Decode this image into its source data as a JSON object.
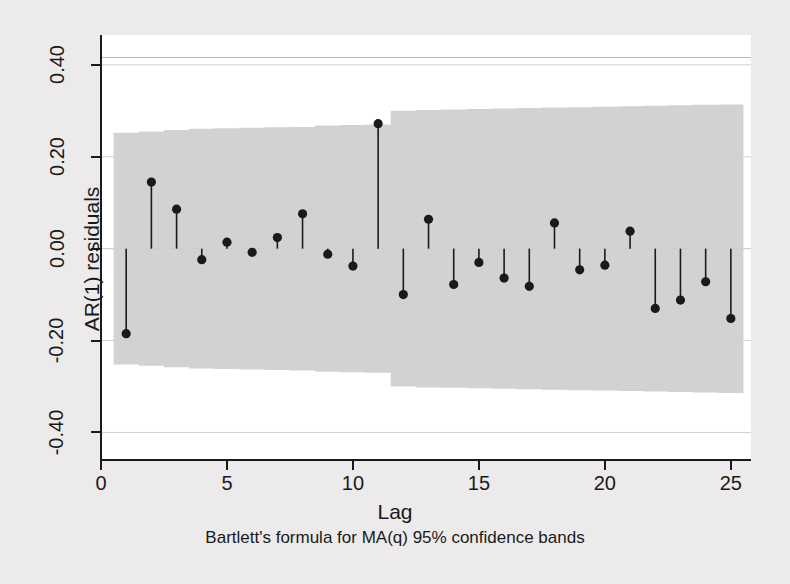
{
  "chart_data": {
    "type": "bar",
    "title": "",
    "subtitle": "",
    "xlabel": "Lag",
    "ylabel": "AR(1) residuals",
    "footnote": "Bartlett's formula for MA(q) 95% confidence bands",
    "xlim": [
      0,
      25.8
    ],
    "ylim": [
      -0.46,
      0.465
    ],
    "xticks": [
      0,
      5,
      10,
      15,
      20,
      25
    ],
    "xtick_labels": [
      "0",
      "5",
      "10",
      "15",
      "20",
      "25"
    ],
    "yticks": [
      0.4,
      0.2,
      0.0,
      -0.2,
      -0.4
    ],
    "ytick_labels": [
      "0.40",
      "0.20",
      "0.00",
      "-0.20",
      "-0.40"
    ],
    "grid": true,
    "legend_position": "none",
    "categories": [
      1,
      2,
      3,
      4,
      5,
      6,
      7,
      8,
      9,
      10,
      11,
      12,
      13,
      14,
      15,
      16,
      17,
      18,
      19,
      20,
      21,
      22,
      23,
      24,
      25
    ],
    "values": [
      -0.185,
      0.145,
      0.086,
      -0.024,
      0.014,
      -0.008,
      0.024,
      0.076,
      -0.012,
      -0.038,
      0.272,
      -0.1,
      0.064,
      -0.078,
      -0.03,
      -0.064,
      -0.082,
      0.056,
      -0.046,
      -0.036,
      0.038,
      -0.13,
      -0.112,
      -0.072,
      -0.152
    ],
    "series": [
      {
        "name": "AR(1) residuals autocorrelation",
        "values": [
          -0.185,
          0.145,
          0.086,
          -0.024,
          0.014,
          -0.008,
          0.024,
          0.076,
          -0.012,
          -0.038,
          0.272,
          -0.1,
          0.064,
          -0.078,
          -0.03,
          -0.064,
          -0.082,
          0.056,
          -0.046,
          -0.036,
          0.038,
          -0.13,
          -0.112,
          -0.072,
          -0.152
        ]
      }
    ],
    "confidence_band": {
      "label": "Bartlett's formula for MA(q) 95% confidence bands",
      "upper": [
        0.252,
        0.255,
        0.258,
        0.261,
        0.262,
        0.263,
        0.264,
        0.265,
        0.268,
        0.269,
        0.27,
        0.3,
        0.302,
        0.303,
        0.304,
        0.305,
        0.306,
        0.307,
        0.308,
        0.309,
        0.31,
        0.311,
        0.312,
        0.313,
        0.314
      ],
      "lower": [
        -0.252,
        -0.255,
        -0.258,
        -0.261,
        -0.262,
        -0.263,
        -0.264,
        -0.265,
        -0.268,
        -0.269,
        -0.27,
        -0.3,
        -0.302,
        -0.303,
        -0.304,
        -0.305,
        -0.306,
        -0.307,
        -0.308,
        -0.309,
        -0.31,
        -0.311,
        -0.312,
        -0.313,
        -0.314
      ],
      "start_lag": 1,
      "end_lag": 25
    }
  },
  "colors": {
    "background": "#eceaea",
    "plot_background": "#ffffff",
    "band_fill": "#d2d2d2",
    "marker": "#1a1a1a",
    "stem": "#1a1a1a",
    "axis": "#1a1a1a",
    "grid": "#cfcfcf"
  }
}
